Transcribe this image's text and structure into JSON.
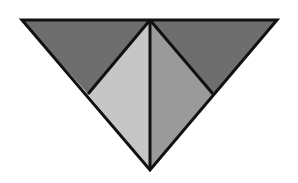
{
  "diagram": {
    "type": "geometric-dissection",
    "outer_triangle": {
      "top_left": [
        22,
        20
      ],
      "top_right": [
        277,
        20
      ],
      "bottom_apex": [
        150,
        170
      ]
    },
    "inner_points": {
      "top_center": [
        150,
        20
      ],
      "left_mid": [
        88,
        94
      ],
      "right_mid": [
        213,
        94
      ]
    },
    "regions": [
      {
        "name": "upper-left",
        "points": [
          [
            22,
            20
          ],
          [
            150,
            20
          ],
          [
            88,
            94
          ]
        ],
        "fill": "#6e6e6e"
      },
      {
        "name": "upper-right",
        "points": [
          [
            150,
            20
          ],
          [
            277,
            20
          ],
          [
            213,
            94
          ]
        ],
        "fill": "#6e6e6e"
      },
      {
        "name": "inner-left",
        "points": [
          [
            150,
            20
          ],
          [
            88,
            94
          ],
          [
            150,
            170
          ]
        ],
        "fill": "#c6c6c6"
      },
      {
        "name": "inner-right",
        "points": [
          [
            150,
            20
          ],
          [
            213,
            94
          ],
          [
            150,
            170
          ]
        ],
        "fill": "#9a9a9a"
      }
    ],
    "stroke": "#111111",
    "stroke_width": 3
  }
}
